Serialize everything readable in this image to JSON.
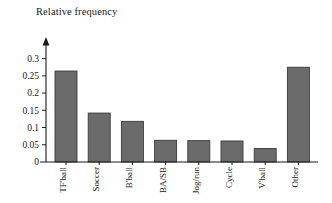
{
  "chart_data": {
    "type": "bar",
    "title": "Relative frequency",
    "xlabel": "",
    "ylabel": "Relative frequency",
    "categories": [
      "TF'ball",
      "Soccer",
      "B'ball",
      "BA/SB",
      "Jog/run",
      "Cycle",
      "V'ball",
      "Other"
    ],
    "values": [
      0.264,
      0.142,
      0.118,
      0.063,
      0.062,
      0.061,
      0.039,
      0.275
    ],
    "ylim": [
      0,
      0.325
    ],
    "ytick_values": [
      0,
      0.05,
      0.1,
      0.15,
      0.2,
      0.25,
      0.3
    ],
    "ytick_labels": [
      "0",
      "0.05",
      "0.1",
      "0.15",
      "0.2",
      "0.25",
      "0.3"
    ],
    "grid": false,
    "legend": null,
    "bar_color": "#6b6b6b",
    "bar_edge_color": "#3a3a3a",
    "axis_color": "#1a1a1a",
    "background_color": "#ffffff",
    "y_axis_arrow": true,
    "category_label_rotation": -90
  }
}
